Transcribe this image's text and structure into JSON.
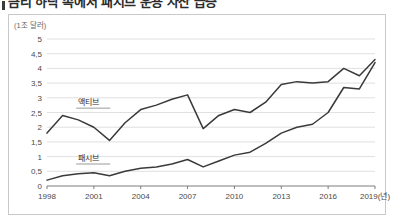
{
  "title": {
    "text": "금리 하락 속에서 패시브 운용 자산 급증",
    "clipped": true
  },
  "unit_label": "(1조 달러)",
  "chart_data": {
    "type": "line",
    "title": "금리 하락 속에서 패시브 운용 자산 급증",
    "xlabel": "(년)",
    "ylabel": "(1조 달러)",
    "ylim": [
      0,
      5
    ],
    "ytick_labels": [
      "0",
      "0,5",
      "1",
      "1,5",
      "2",
      "2,5",
      "3",
      "3,5",
      "4",
      "4,5",
      "5"
    ],
    "ytick_values": [
      0,
      0.5,
      1,
      1.5,
      2,
      2.5,
      3,
      3.5,
      4,
      4.5,
      5
    ],
    "xtick_labels": [
      "1998",
      "2001",
      "2004",
      "2007",
      "2010",
      "2013",
      "2016",
      "2019(년)"
    ],
    "xtick_values": [
      1998,
      2001,
      2004,
      2007,
      2010,
      2013,
      2016,
      2019
    ],
    "xlim": [
      1998,
      2019
    ],
    "grid": true,
    "legend": "inline-labels",
    "x": [
      1998,
      1999,
      2000,
      2001,
      2002,
      2003,
      2004,
      2005,
      2006,
      2007,
      2008,
      2009,
      2010,
      2011,
      2012,
      2013,
      2014,
      2015,
      2016,
      2017,
      2018,
      2019
    ],
    "series": [
      {
        "name": "액티브",
        "label_x": 2000,
        "label_y": 2.75,
        "values": [
          1.8,
          2.4,
          2.25,
          2.0,
          1.55,
          2.15,
          2.6,
          2.75,
          2.95,
          3.1,
          1.95,
          2.4,
          2.6,
          2.5,
          2.85,
          3.45,
          3.55,
          3.5,
          3.55,
          4.0,
          3.75,
          4.3
        ]
      },
      {
        "name": "패시브",
        "label_x": 2000,
        "label_y": 0.85,
        "values": [
          0.2,
          0.35,
          0.42,
          0.45,
          0.35,
          0.5,
          0.6,
          0.65,
          0.75,
          0.9,
          0.65,
          0.85,
          1.05,
          1.15,
          1.45,
          1.8,
          2.0,
          2.1,
          2.5,
          3.35,
          3.3,
          4.2
        ]
      }
    ]
  }
}
